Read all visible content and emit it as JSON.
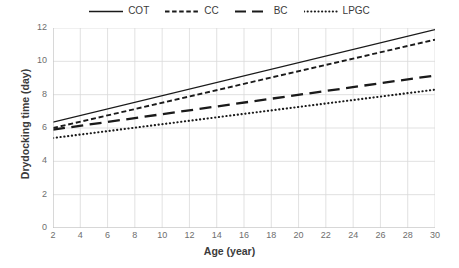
{
  "chart_data": {
    "type": "line",
    "title": "",
    "xlabel": "Age (year)",
    "ylabel": "Drydocking time (day)",
    "xlim": [
      2,
      30
    ],
    "ylim": [
      0,
      12
    ],
    "xticks": [
      2,
      4,
      6,
      8,
      10,
      12,
      14,
      16,
      18,
      20,
      22,
      24,
      26,
      28,
      30
    ],
    "yticks": [
      0,
      2,
      4,
      6,
      8,
      10,
      12
    ],
    "grid": true,
    "legend_position": "top-center",
    "x": [
      2,
      30
    ],
    "series": [
      {
        "name": "COT",
        "values": [
          6.35,
          11.9
        ],
        "style": "solid",
        "color": "#1a1a1a"
      },
      {
        "name": "CC",
        "values": [
          6.0,
          11.3
        ],
        "style": "dashed",
        "color": "#1a1a1a"
      },
      {
        "name": "BC",
        "values": [
          5.9,
          9.15
        ],
        "style": "long-dash",
        "color": "#1a1a1a"
      },
      {
        "name": "LPGC",
        "values": [
          5.4,
          8.3
        ],
        "style": "dotted",
        "color": "#1a1a1a"
      }
    ]
  },
  "legend": {
    "items": [
      {
        "label": "COT"
      },
      {
        "label": "CC"
      },
      {
        "label": "BC"
      },
      {
        "label": "LPGC"
      }
    ]
  },
  "axes": {
    "x_title": "Age (year)",
    "y_title": "Drydocking time (day)",
    "x_tick_labels": [
      "2",
      "4",
      "6",
      "8",
      "10",
      "12",
      "14",
      "16",
      "18",
      "20",
      "22",
      "24",
      "26",
      "28",
      "30"
    ],
    "y_tick_labels": [
      "0",
      "2",
      "4",
      "6",
      "8",
      "10",
      "12"
    ]
  },
  "colors": {
    "line": "#1a1a1a",
    "grid": "#d9d9d9",
    "axis": "#bfbfbf",
    "text": "#3b3b3b",
    "tick_text": "#6e6e6e",
    "background": "#ffffff"
  }
}
